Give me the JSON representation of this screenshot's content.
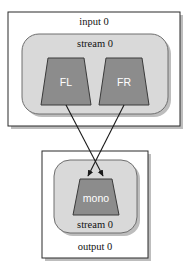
{
  "diagram": {
    "type": "audio-channel-downmix-graph",
    "input_container": {
      "label": "input 0",
      "stream": {
        "label": "stream 0",
        "channels": [
          {
            "id": "fl",
            "label": "FL"
          },
          {
            "id": "fr",
            "label": "FR"
          }
        ]
      }
    },
    "output_container": {
      "label": "output 0",
      "stream": {
        "label": "stream 0",
        "channels": [
          {
            "id": "mono",
            "label": "mono"
          }
        ]
      }
    },
    "edges": [
      {
        "from": "FL",
        "to": "mono"
      },
      {
        "from": "FR",
        "to": "mono"
      }
    ],
    "colors": {
      "page_background": "#ffffff",
      "container_fill": "#ffffff",
      "container_stroke": "#2b2b2b",
      "stream_fill": "#d9d9d9",
      "stream_stroke": "#6e6e6e",
      "channel_fill": "#8c8c8c",
      "channel_stroke": "#3a3a3a",
      "channel_text": "#ffffff",
      "label_text": "#111111",
      "edge_stroke": "#1a1a1a",
      "shadow": "#bdbdbd"
    }
  }
}
